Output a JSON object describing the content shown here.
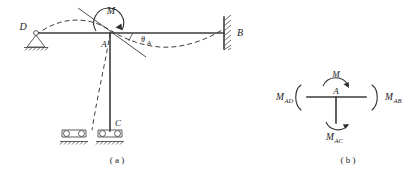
{
  "figure": {
    "caption_a": "( a )",
    "caption_b": "( b )",
    "panel_a": {
      "joint_label": "A",
      "support_left_label": "D",
      "support_right_label": "B",
      "column_base_label": "C",
      "applied_moment_label": "M",
      "rotation_label": "θ",
      "rotation_subscript": "A",
      "supports": [
        {
          "name": "pin-support-D",
          "type": "pin",
          "label": "D"
        },
        {
          "name": "fixed-support-B",
          "type": "fixed",
          "label": "B"
        },
        {
          "name": "roller-support-left",
          "type": "roller",
          "label": ""
        },
        {
          "name": "roller-support-C",
          "type": "roller",
          "label": "C"
        }
      ],
      "members": [
        {
          "name": "beam-DA",
          "from": "D",
          "to": "A"
        },
        {
          "name": "beam-AB",
          "from": "A",
          "to": "B"
        },
        {
          "name": "column-AC",
          "from": "A",
          "to": "C"
        }
      ]
    },
    "panel_b": {
      "joint_label": "A",
      "applied_moment_label": "M",
      "moment_left": "M",
      "moment_left_sub": "AD",
      "moment_right": "M",
      "moment_right_sub": "AB",
      "moment_bottom": "M",
      "moment_bottom_sub": "AC"
    }
  },
  "colors": {
    "ink": "#2e2e2e",
    "line": "#3a3a3a",
    "thin": "#4a4a4a",
    "background": "#ffffff"
  }
}
